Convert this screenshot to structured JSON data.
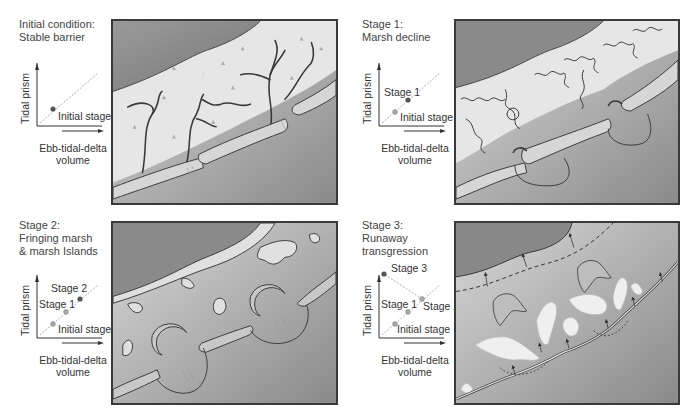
{
  "figure": {
    "panels": [
      {
        "id": "initial",
        "caption": "Initial condition:\nStable barrier",
        "chart": {
          "ylabel": "Tidal prism",
          "xlabel": "Ebb-tidal-delta\nvolume",
          "points": [
            {
              "label": "Initial stage"
            }
          ]
        },
        "map_description": "Continuous back-barrier marsh with dendritic tidal creeks; barrier islands with tidal inlets and ebb deltas"
      },
      {
        "id": "stage1",
        "caption": "Stage 1:\nMarsh decline",
        "chart": {
          "ylabel": "Tidal prism",
          "xlabel": "Ebb-tidal-delta\nvolume",
          "points": [
            {
              "label": "Initial stage"
            },
            {
              "label": "Stage 1"
            }
          ]
        },
        "map_description": "Fragmenting marsh, enlarged ebb-tidal deltas and flood-tidal shoals"
      },
      {
        "id": "stage2",
        "caption": "Stage 2:\nFringing marsh\n& marsh Islands",
        "chart": {
          "ylabel": "Tidal prism",
          "xlabel": "Ebb-tidal-delta\nvolume",
          "points": [
            {
              "label": "Initial stage"
            },
            {
              "label": "Stage 1"
            },
            {
              "label": "Stage 2"
            }
          ]
        },
        "map_description": "Fringing marsh along mainland, isolated marsh islands, large crescent flood deltas"
      },
      {
        "id": "stage3",
        "caption": "Stage 3:\nRunaway\ntransgression",
        "chart": {
          "ylabel": "Tidal prism",
          "xlabel": "Ebb-tidal-delta\nvolume",
          "points": [
            {
              "label": "Initial stage"
            },
            {
              "label": "Stage 1"
            },
            {
              "label": "Stage 2"
            },
            {
              "label": "Stage 3"
            }
          ]
        },
        "map_description": "Landward migrating barrier with washover fans, retreating shoreline (dashed) and arrows"
      }
    ]
  },
  "colors": {
    "land_dark": "#7a7a7a",
    "marsh": "#dcdcdc",
    "water_light": "#d0d0d0",
    "water_dark": "#8c8c8c",
    "outline": "#333333",
    "point": "#555555"
  }
}
